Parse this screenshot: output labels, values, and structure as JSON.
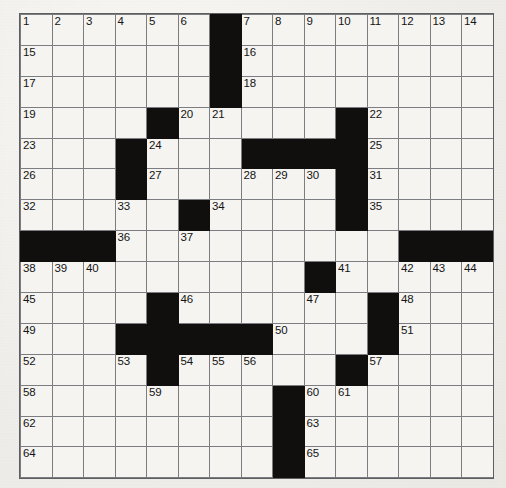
{
  "puzzle": {
    "type": "crossword-grid",
    "columns": 15,
    "rows": 15,
    "cell_background": "#f5f4f1",
    "block_color": "#100f0d",
    "grid_line_color": "#7c7d80",
    "page_background": "#f2f1ee",
    "highest_clue_number": 65,
    "cells": [
      [
        {
          "n": "1"
        },
        {
          "n": "2"
        },
        {
          "n": "3"
        },
        {
          "n": "4"
        },
        {
          "n": "5"
        },
        {
          "n": "6"
        },
        {
          "b": 1
        },
        {
          "n": "7"
        },
        {
          "n": "8"
        },
        {
          "n": "9"
        },
        {
          "n": "10"
        },
        {
          "n": "11"
        },
        {
          "n": "12"
        },
        {
          "n": "13"
        },
        {
          "n": "14"
        }
      ],
      [
        {
          "n": "15"
        },
        {},
        {},
        {},
        {},
        {},
        {
          "b": 1
        },
        {
          "n": "16"
        },
        {},
        {},
        {},
        {},
        {},
        {},
        {}
      ],
      [
        {
          "n": "17"
        },
        {},
        {},
        {},
        {},
        {},
        {
          "b": 1
        },
        {
          "n": "18"
        },
        {},
        {},
        {},
        {},
        {},
        {},
        {}
      ],
      [
        {
          "n": "19"
        },
        {},
        {},
        {},
        {
          "b": 1
        },
        {
          "n": "20"
        },
        {
          "n": "21"
        },
        {},
        {},
        {},
        {
          "b": 1
        },
        {
          "n": "22"
        },
        {},
        {},
        {}
      ],
      [
        {
          "n": "23"
        },
        {},
        {},
        {
          "b": 1
        },
        {
          "n": "24"
        },
        {},
        {},
        {
          "b": 1
        },
        {
          "b": 1
        },
        {
          "b": 1
        },
        {
          "b": 1
        },
        {
          "n": "25"
        },
        {},
        {},
        {}
      ],
      [
        {
          "n": "26"
        },
        {},
        {},
        {
          "b": 1
        },
        {
          "n": "27"
        },
        {},
        {},
        {
          "n": "28"
        },
        {
          "n": "29"
        },
        {
          "n": "30"
        },
        {
          "b": 1
        },
        {
          "n": "31"
        },
        {},
        {},
        {}
      ],
      [
        {
          "n": "32"
        },
        {},
        {},
        {
          "n": "33"
        },
        {},
        {
          "b": 1
        },
        {
          "n": "34"
        },
        {},
        {},
        {},
        {
          "b": 1
        },
        {
          "n": "35"
        },
        {},
        {},
        {}
      ],
      [
        {
          "b": 1
        },
        {
          "b": 1
        },
        {
          "b": 1
        },
        {
          "n": "36"
        },
        {},
        {
          "n": "37"
        },
        {},
        {},
        {},
        {},
        {},
        {},
        {
          "b": 1
        },
        {
          "b": 1
        },
        {
          "b": 1
        }
      ],
      [
        {
          "n": "38"
        },
        {
          "n": "39"
        },
        {
          "n": "40"
        },
        {},
        {},
        {},
        {},
        {},
        {},
        {
          "b": 1
        },
        {
          "n": "41"
        },
        {},
        {
          "n": "42"
        },
        {
          "n": "43"
        },
        {
          "n": "44"
        }
      ],
      [
        {
          "n": "45"
        },
        {},
        {},
        {},
        {
          "b": 1
        },
        {
          "n": "46"
        },
        {},
        {},
        {},
        {
          "n": "47"
        },
        {},
        {
          "b": 1
        },
        {
          "n": "48"
        },
        {},
        {}
      ],
      [
        {
          "n": "49"
        },
        {},
        {},
        {
          "b": 1
        },
        {
          "b": 1
        },
        {
          "b": 1
        },
        {
          "b": 1
        },
        {
          "b": 1
        },
        {
          "n": "50"
        },
        {},
        {},
        {
          "b": 1
        },
        {
          "n": "51"
        },
        {},
        {}
      ],
      [
        {
          "n": "52"
        },
        {},
        {},
        {
          "n": "53"
        },
        {
          "b": 1
        },
        {
          "n": "54"
        },
        {
          "n": "55"
        },
        {
          "n": "56"
        },
        {},
        {},
        {
          "b": 1
        },
        {
          "n": "57"
        },
        {},
        {},
        {}
      ],
      [
        {
          "n": "58"
        },
        {},
        {},
        {},
        {
          "n": "59"
        },
        {},
        {},
        {},
        {
          "b": 1
        },
        {
          "n": "60"
        },
        {
          "n": "61"
        },
        {},
        {},
        {},
        {}
      ],
      [
        {
          "n": "62"
        },
        {},
        {},
        {},
        {},
        {},
        {},
        {},
        {
          "b": 1
        },
        {
          "n": "63"
        },
        {},
        {},
        {},
        {},
        {}
      ],
      [
        {
          "n": "64"
        },
        {},
        {},
        {},
        {},
        {},
        {},
        {},
        {
          "b": 1
        },
        {
          "n": "65"
        },
        {},
        {},
        {},
        {},
        {}
      ]
    ]
  }
}
